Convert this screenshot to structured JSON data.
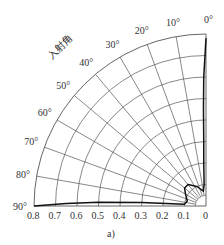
{
  "chart_data": {
    "type": "polar-line",
    "title": "",
    "caption": "a)",
    "angular_axis_label": "入射角",
    "angular_ticks": [
      "0°",
      "10°",
      "20°",
      "30°",
      "40°",
      "50°",
      "60°",
      "70°",
      "80°",
      "90°"
    ],
    "angular_range_deg": [
      0,
      90
    ],
    "radial_ticks": [
      "0.8",
      "0.7",
      "0.6",
      "0.5",
      "0.4",
      "0.3",
      "0.2",
      "0.1",
      "0"
    ],
    "radial_range": [
      0,
      0.8
    ],
    "grid": true,
    "series": [
      {
        "name": "reflectance",
        "points_deg_r": [
          [
            0,
            0.78
          ],
          [
            1,
            0.6
          ],
          [
            1.5,
            0.45
          ],
          [
            2,
            0.3
          ],
          [
            3,
            0.2
          ],
          [
            5,
            0.1
          ],
          [
            10,
            0.07
          ],
          [
            25,
            0.1
          ],
          [
            40,
            0.13
          ],
          [
            50,
            0.13
          ],
          [
            60,
            0.11
          ],
          [
            75,
            0.09
          ],
          [
            85,
            0.1
          ],
          [
            87,
            0.3
          ],
          [
            88,
            0.5
          ],
          [
            89,
            0.65
          ],
          [
            90,
            0.8
          ]
        ]
      }
    ],
    "colors": {
      "grid": "#555555",
      "curve": "#111111",
      "text": "#333333"
    }
  }
}
